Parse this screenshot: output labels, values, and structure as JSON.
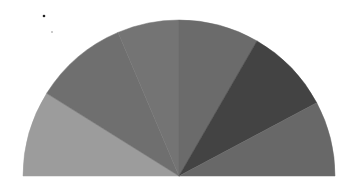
{
  "chart_data": {
    "type": "pie",
    "variant": "semicircle",
    "title": "",
    "categories": [
      "Slice 1",
      "Slice 2",
      "Slice 3",
      "Slice 4",
      "Slice 5",
      "Slice 6"
    ],
    "values": [
      32,
      35,
      23,
      30,
      32,
      28
    ],
    "colors": [
      "#9c9c9c",
      "#6f6f6f",
      "#747474",
      "#6b6b6b",
      "#434343",
      "#686868"
    ],
    "start_angle_deg": 180,
    "end_angle_deg": 0,
    "legend": "none",
    "data_labels": "none",
    "geometry": {
      "cx": 179,
      "cy": 176,
      "r": 156
    }
  },
  "decorations": {
    "dots": [
      {
        "x": 44,
        "y": 16,
        "r": 1.3,
        "color": "#222222"
      },
      {
        "x": 52,
        "y": 32,
        "r": 1.0,
        "color": "#bbbbbb"
      }
    ]
  }
}
